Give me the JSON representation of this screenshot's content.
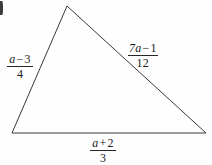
{
  "figure": {
    "type": "triangle-diagram",
    "background_color": "#fefefe",
    "stroke_color": "#3a3a3a",
    "stroke_width": 1,
    "vertices": {
      "apex": {
        "x": 67,
        "y": 6
      },
      "bottom_left": {
        "x": 12,
        "y": 133
      },
      "bottom_right": {
        "x": 206,
        "y": 133
      }
    },
    "corner_mark": {
      "name": "cropped-figure-label-sliver",
      "color": "#3b3b3b"
    }
  },
  "labels": {
    "left": {
      "name": "left-side-label",
      "numerator_var": "a",
      "numerator_op": "−",
      "numerator_num": "3",
      "denominator": "4",
      "full_text": "(a − 3) / 4"
    },
    "right": {
      "name": "right-side-label",
      "numerator_var": "7a",
      "numerator_op": "−",
      "numerator_num": "1",
      "denominator": "12",
      "full_text": "(7a − 1) / 12"
    },
    "bottom": {
      "name": "bottom-side-label",
      "numerator_var": "a",
      "numerator_op": "+",
      "numerator_num": "2",
      "denominator": "3",
      "full_text": "(a + 2) / 3"
    }
  }
}
